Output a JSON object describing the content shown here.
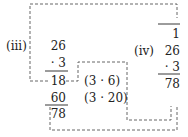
{
  "left": {
    "label": "(iii)",
    "multiplicand": "26",
    "multiplier": "· 3",
    "partial1": "18",
    "partial2": "60",
    "result": "78"
  },
  "middle": {
    "note1": "(3 · 6)",
    "note2": "(3 · 20)"
  },
  "right": {
    "label": "(iv)",
    "carry": "1",
    "multiplicand": "26",
    "multiplier": "· 3",
    "result": "78"
  },
  "colors": {
    "text": "#222222",
    "dash": "#555555"
  }
}
